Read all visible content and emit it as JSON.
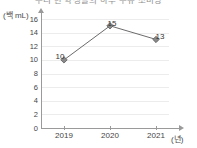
{
  "title": {
    "text": "우리 반 학생들의 하루 우유 소비량"
  },
  "axes": {
    "y_unit_label": "(백 mL)",
    "x_unit_label": "(년)",
    "y_ticks": [
      "0",
      "2",
      "4",
      "6",
      "8",
      "10",
      "12",
      "14",
      "16"
    ],
    "x_ticks": [
      "2019",
      "2020",
      "2021"
    ]
  },
  "chart_data": {
    "type": "line",
    "title": "우리 반 학생들의 하루 우유 소비량",
    "xlabel": "(년)",
    "ylabel": "(백 mL)",
    "categories": [
      "2019",
      "2020",
      "2021"
    ],
    "values": [
      10,
      15,
      13
    ],
    "point_labels": [
      "10",
      "15",
      "13"
    ],
    "ylim": [
      0,
      17
    ],
    "ytick_step": 2,
    "grid": true,
    "legend": false,
    "marker": "diamond",
    "line_color": "#6b6b6b",
    "marker_color": "#8a8a8a",
    "grid_color": "#ececec",
    "axis_color": "#9a9a9a",
    "background": "#ffffff"
  }
}
